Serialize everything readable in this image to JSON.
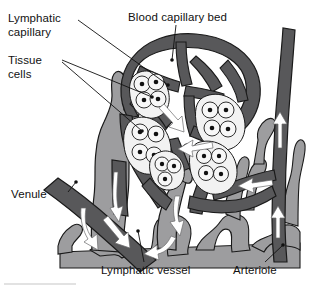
{
  "figure": {
    "palette": {
      "background": "#ffffff",
      "blood_vessel_dark": "#58585a",
      "lymphatic_gray": "#9d9d9f",
      "outline": "#1a1a1a",
      "arrow_white": "#ffffff",
      "cell_fill": "#f2f2f2",
      "nucleus": "#111111",
      "leader_line": "#111111",
      "text": "#111111",
      "footer_rule": "#d8d8d8"
    },
    "labels": [
      {
        "id": "lymphatic-capillary",
        "text": "Lymphatic\ncapillary",
        "position": "top-left"
      },
      {
        "id": "tissue-cells",
        "text": "Tissue\ncells",
        "position": "upper-left"
      },
      {
        "id": "blood-capillary-bed",
        "text": "Blood capillary bed",
        "position": "top-center"
      },
      {
        "id": "venule",
        "text": "Venule",
        "position": "mid-left"
      },
      {
        "id": "lymphatic-vessel",
        "text": "Lymphatic vessel",
        "position": "bottom-center"
      },
      {
        "id": "arteriole",
        "text": "Arteriole",
        "position": "bottom-right"
      }
    ],
    "structures": [
      {
        "id": "blood-capillary-bed",
        "tone": "dark-gray",
        "description": "branching mesh of capillaries"
      },
      {
        "id": "lymphatic-capillary",
        "tone": "medium-gray",
        "description": "blind-ended lymphatic capillary"
      },
      {
        "id": "lymphatic-vessel",
        "tone": "medium-gray",
        "description": "collecting lymphatic vessel network"
      },
      {
        "id": "venule",
        "tone": "dark-gray",
        "description": "venule draining blood"
      },
      {
        "id": "arteriole",
        "tone": "dark-gray",
        "description": "arteriole supplying blood"
      },
      {
        "id": "tissue-cells",
        "tone": "light",
        "description": "clusters of tissue cells with nuclei"
      }
    ],
    "flow_arrows": [
      {
        "id": "arteriole-inflow-lower",
        "direction": "up"
      },
      {
        "id": "arteriole-inflow-upper",
        "direction": "up"
      },
      {
        "id": "venule-outflow-upper",
        "direction": "down"
      },
      {
        "id": "venule-outflow-lower",
        "direction": "down"
      },
      {
        "id": "lymph-uptake-upper",
        "direction": "down-left"
      },
      {
        "id": "lymph-uptake-center",
        "direction": "left"
      },
      {
        "id": "lymph-drain-lower",
        "direction": "down"
      },
      {
        "id": "lymph-drain-bottom",
        "direction": "down-left"
      },
      {
        "id": "interstitial-inflow",
        "direction": "down-right"
      }
    ]
  }
}
